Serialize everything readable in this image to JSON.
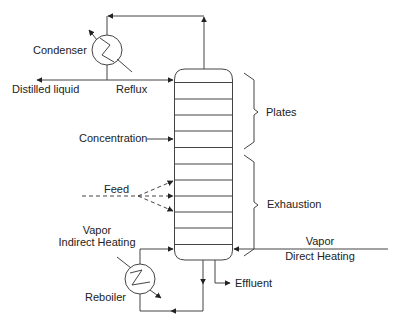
{
  "diagram": {
    "type": "distillation-column-schematic",
    "line_color": "#333333",
    "labels": {
      "condenser": "Condenser",
      "distilled_liquid": "Distilled liquid",
      "reflux": "Reflux",
      "plates": "Plates",
      "concentration": "Concentration",
      "feed": "Feed",
      "exhaustion": "Exhaustion",
      "vapor_indirect_line1": "Vapor",
      "vapor_indirect_line2": "Indirect Heating",
      "vapor_direct_line1": "Vapor",
      "vapor_direct_line2": "Direct Heating",
      "reboiler": "Reboiler",
      "effluent": "Effluent"
    },
    "column": {
      "plate_count": 11,
      "sections": [
        "Plates",
        "Exhaustion"
      ]
    },
    "components": [
      {
        "id": "condenser",
        "label": "Condenser",
        "kind": "heat-exchanger"
      },
      {
        "id": "column",
        "label": "Distillation column",
        "kind": "plate-column"
      },
      {
        "id": "reboiler",
        "label": "Reboiler",
        "kind": "heat-exchanger"
      }
    ],
    "flows": [
      {
        "from": "column-top",
        "to": "condenser"
      },
      {
        "from": "condenser",
        "to": "Distilled liquid"
      },
      {
        "from": "condenser",
        "to": "column",
        "label": "Reflux"
      },
      {
        "from": "Concentration",
        "to": "column"
      },
      {
        "from": "Feed",
        "to": "column",
        "count": 3,
        "style": "dashed"
      },
      {
        "from": "column-bottom",
        "to": "reboiler"
      },
      {
        "from": "reboiler",
        "to": "column",
        "label": "Vapor Indirect Heating"
      },
      {
        "from": "Vapor Direct Heating",
        "to": "column"
      },
      {
        "from": "column-bottom",
        "to": "Effluent"
      }
    ]
  }
}
